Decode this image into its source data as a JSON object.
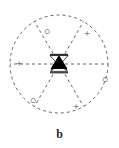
{
  "figure": {
    "panel_label": "b",
    "label_name": "panel-b-label",
    "colors": {
      "background": "#ffffff",
      "dashed_stroke": "#555555",
      "center_fill": "#000000",
      "symbol_color": "#4a4a4a",
      "label_color": "#2a2a2a"
    },
    "geometry": {
      "center_x": 59,
      "center_y": 64,
      "radius": 49,
      "dash_pattern": "3 3",
      "stroke_width": 0.9
    },
    "outer_circle": {
      "name": "outer-dashed-circle",
      "style": "dashed"
    },
    "radial_lines": [
      {
        "name": "radial-line-1",
        "angle_deg": 0,
        "style": "dashed"
      },
      {
        "name": "radial-line-2",
        "angle_deg": 60,
        "style": "dashed"
      },
      {
        "name": "radial-line-3",
        "angle_deg": 120,
        "style": "dashed"
      },
      {
        "name": "radial-line-4",
        "angle_deg": 180,
        "style": "dashed"
      },
      {
        "name": "radial-line-5",
        "angle_deg": 240,
        "style": "dashed"
      },
      {
        "name": "radial-line-6",
        "angle_deg": 300,
        "style": "dashed"
      }
    ],
    "center_marker": {
      "name": "center-triangle-marker",
      "shape": "filled-triangle-up-with-bars",
      "upper_bar": "bowtie-top-bar",
      "lower_bar": "bowtie-bottom-bar",
      "fill": "#000000"
    },
    "sector_symbols": [
      {
        "id": "s1",
        "symbol": "○",
        "semantic": "open-circle-symbol",
        "name": "sector-symbol-top-left-circle",
        "x": 41,
        "y": 26
      },
      {
        "id": "s2",
        "symbol": "+",
        "semantic": "plus-symbol",
        "name": "sector-symbol-top-right-plus",
        "x": 81,
        "y": 28
      },
      {
        "id": "s3",
        "symbol": "+",
        "semantic": "plus-symbol",
        "name": "sector-symbol-left-plus",
        "x": 13,
        "y": 58
      },
      {
        "id": "s4",
        "symbol": "○",
        "semantic": "open-circle-symbol",
        "name": "sector-symbol-right-circle",
        "x": 99,
        "y": 74
      },
      {
        "id": "s5",
        "symbol": "○",
        "semantic": "open-circle-symbol",
        "name": "sector-symbol-bottom-left-circle",
        "x": 27,
        "y": 95
      },
      {
        "id": "s6",
        "symbol": "+",
        "semantic": "plus-symbol",
        "name": "sector-symbol-bottom-right-plus",
        "x": 70,
        "y": 101
      }
    ]
  }
}
